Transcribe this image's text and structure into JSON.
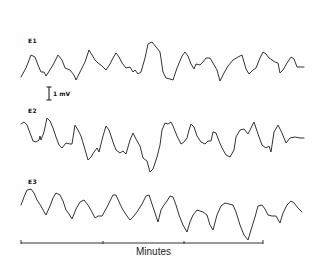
{
  "figure": {
    "traces": [
      {
        "label": "E1",
        "label_x": 28,
        "label_y": 37
      },
      {
        "label": "E2",
        "label_x": 28,
        "label_y": 107
      },
      {
        "label": "E3",
        "label_x": 28,
        "label_y": 177
      }
    ],
    "scale_bar": {
      "label": "1 mV"
    },
    "time_axis": {
      "label": "Minutes",
      "ticks": 4
    }
  },
  "chart_data": {
    "type": "line",
    "title": "",
    "xlabel": "Minutes",
    "ylabel": "",
    "scale_bar": "1 mV",
    "grid": false,
    "x_ticks_count": 4,
    "series": [
      {
        "name": "E1",
        "points": [
          [
            21,
            77
          ],
          [
            26,
            68
          ],
          [
            31,
            55
          ],
          [
            35,
            57
          ],
          [
            38,
            65
          ],
          [
            41,
            72
          ],
          [
            44,
            72
          ],
          [
            46,
            76
          ],
          [
            48,
            73
          ],
          [
            53,
            65
          ],
          [
            58,
            55
          ],
          [
            62,
            60
          ],
          [
            65,
            68
          ],
          [
            70,
            70
          ],
          [
            74,
            75
          ],
          [
            76,
            80
          ],
          [
            80,
            72
          ],
          [
            85,
            62
          ],
          [
            89,
            50
          ],
          [
            92,
            55
          ],
          [
            95,
            60
          ],
          [
            98,
            63
          ],
          [
            102,
            66
          ],
          [
            106,
            70
          ],
          [
            110,
            64
          ],
          [
            113,
            58
          ],
          [
            116,
            53
          ],
          [
            119,
            57
          ],
          [
            122,
            63
          ],
          [
            126,
            68
          ],
          [
            130,
            67
          ],
          [
            133,
            72
          ],
          [
            135,
            70
          ],
          [
            138,
            74
          ],
          [
            141,
            72
          ],
          [
            145,
            58
          ],
          [
            148,
            44
          ],
          [
            152,
            42
          ],
          [
            156,
            47
          ],
          [
            160,
            52
          ],
          [
            163,
            72
          ],
          [
            166,
            78
          ],
          [
            170,
            79
          ],
          [
            173,
            80
          ],
          [
            177,
            68
          ],
          [
            182,
            56
          ],
          [
            185,
            52
          ],
          [
            188,
            56
          ],
          [
            191,
            64
          ],
          [
            194,
            69
          ],
          [
            196,
            64
          ],
          [
            200,
            65
          ],
          [
            203,
            62
          ],
          [
            206,
            58
          ],
          [
            210,
            58
          ],
          [
            213,
            63
          ],
          [
            217,
            70
          ],
          [
            220,
            81
          ],
          [
            224,
            73
          ],
          [
            228,
            66
          ],
          [
            233,
            60
          ],
          [
            238,
            57
          ],
          [
            242,
            55
          ],
          [
            246,
            69
          ],
          [
            249,
            74
          ],
          [
            253,
            70
          ],
          [
            256,
            68
          ],
          [
            260,
            58
          ],
          [
            263,
            52
          ],
          [
            266,
            54
          ],
          [
            269,
            58
          ],
          [
            272,
            60
          ],
          [
            275,
            62
          ],
          [
            278,
            63
          ],
          [
            280,
            73
          ],
          [
            283,
            70
          ],
          [
            287,
            63
          ],
          [
            291,
            57
          ],
          [
            294,
            59
          ],
          [
            297,
            67
          ],
          [
            300,
            67
          ],
          [
            304,
            67
          ]
        ]
      },
      {
        "name": "E2",
        "points": [
          [
            21,
            124
          ],
          [
            24,
            122
          ],
          [
            27,
            125
          ],
          [
            30,
            133
          ],
          [
            33,
            141
          ],
          [
            36,
            142
          ],
          [
            39,
            140
          ],
          [
            40,
            136
          ],
          [
            41,
            140
          ],
          [
            44,
            132
          ],
          [
            47,
            118
          ],
          [
            50,
            121
          ],
          [
            53,
            128
          ],
          [
            56,
            137
          ],
          [
            59,
            145
          ],
          [
            62,
            148
          ],
          [
            66,
            143
          ],
          [
            70,
            144
          ],
          [
            72,
            144
          ],
          [
            75,
            125
          ],
          [
            78,
            130
          ],
          [
            81,
            136
          ],
          [
            84,
            146
          ],
          [
            88,
            160
          ],
          [
            91,
            157
          ],
          [
            94,
            152
          ],
          [
            97,
            148
          ],
          [
            99,
            152
          ],
          [
            103,
            136
          ],
          [
            106,
            126
          ],
          [
            109,
            130
          ],
          [
            113,
            142
          ],
          [
            116,
            150
          ],
          [
            120,
            153
          ],
          [
            123,
            151
          ],
          [
            126,
            154
          ],
          [
            130,
            140
          ],
          [
            133,
            133
          ],
          [
            136,
            139
          ],
          [
            140,
            146
          ],
          [
            143,
            158
          ],
          [
            147,
            161
          ],
          [
            150,
            172
          ],
          [
            153,
            169
          ],
          [
            157,
            157
          ],
          [
            160,
            145
          ],
          [
            162,
            130
          ],
          [
            165,
            123
          ],
          [
            168,
            124
          ],
          [
            171,
            122
          ],
          [
            173,
            126
          ],
          [
            177,
            136
          ],
          [
            181,
            144
          ],
          [
            184,
            142
          ],
          [
            187,
            138
          ],
          [
            189,
            130
          ],
          [
            191,
            124
          ],
          [
            194,
            127
          ],
          [
            197,
            136
          ],
          [
            201,
            142
          ],
          [
            205,
            144
          ],
          [
            208,
            141
          ],
          [
            211,
            141
          ],
          [
            213,
            132
          ],
          [
            216,
            133
          ],
          [
            219,
            141
          ],
          [
            222,
            148
          ],
          [
            226,
            155
          ],
          [
            230,
            157
          ],
          [
            234,
            150
          ],
          [
            236,
            137
          ],
          [
            240,
            130
          ],
          [
            244,
            129
          ],
          [
            248,
            134
          ],
          [
            251,
            128
          ],
          [
            254,
            122
          ],
          [
            258,
            134
          ],
          [
            262,
            145
          ],
          [
            266,
            148
          ],
          [
            269,
            146
          ],
          [
            271,
            152
          ],
          [
            274,
            132
          ],
          [
            278,
            125
          ],
          [
            282,
            133
          ],
          [
            286,
            143
          ],
          [
            290,
            138
          ],
          [
            295,
            137
          ],
          [
            300,
            138
          ],
          [
            304,
            138
          ]
        ]
      },
      {
        "name": "E3",
        "points": [
          [
            21,
            205
          ],
          [
            24,
            197
          ],
          [
            27,
            190
          ],
          [
            31,
            189
          ],
          [
            34,
            193
          ],
          [
            37,
            200
          ],
          [
            41,
            206
          ],
          [
            43,
            210
          ],
          [
            46,
            215
          ],
          [
            50,
            206
          ],
          [
            53,
            198
          ],
          [
            56,
            193
          ],
          [
            60,
            195
          ],
          [
            63,
            201
          ],
          [
            66,
            210
          ],
          [
            69,
            214
          ],
          [
            72,
            219
          ],
          [
            76,
            209
          ],
          [
            80,
            202
          ],
          [
            84,
            200
          ],
          [
            88,
            205
          ],
          [
            92,
            212
          ],
          [
            95,
            218
          ],
          [
            98,
            216
          ],
          [
            102,
            216
          ],
          [
            106,
            209
          ],
          [
            110,
            201
          ],
          [
            113,
            195
          ],
          [
            116,
            195
          ],
          [
            120,
            204
          ],
          [
            123,
            210
          ],
          [
            127,
            216
          ],
          [
            130,
            220
          ],
          [
            133,
            217
          ],
          [
            137,
            212
          ],
          [
            142,
            204
          ],
          [
            146,
            196
          ],
          [
            149,
            195
          ],
          [
            152,
            204
          ],
          [
            155,
            213
          ],
          [
            158,
            222
          ],
          [
            161,
            210
          ],
          [
            164,
            205
          ],
          [
            167,
            201
          ],
          [
            170,
            196
          ],
          [
            173,
            197
          ],
          [
            176,
            205
          ],
          [
            179,
            215
          ],
          [
            183,
            225
          ],
          [
            187,
            232
          ],
          [
            190,
            222
          ],
          [
            193,
            215
          ],
          [
            197,
            210
          ],
          [
            200,
            211
          ],
          [
            203,
            212
          ],
          [
            207,
            215
          ],
          [
            210,
            225
          ],
          [
            213,
            230
          ],
          [
            217,
            215
          ],
          [
            221,
            206
          ],
          [
            225,
            203
          ],
          [
            229,
            204
          ],
          [
            233,
            205
          ],
          [
            236,
            212
          ],
          [
            240,
            225
          ],
          [
            244,
            235
          ],
          [
            248,
            240
          ],
          [
            251,
            230
          ],
          [
            255,
            217
          ],
          [
            258,
            206
          ],
          [
            262,
            205
          ],
          [
            265,
            209
          ],
          [
            268,
            215
          ],
          [
            272,
            216
          ],
          [
            276,
            216
          ],
          [
            280,
            223
          ],
          [
            283,
            213
          ],
          [
            287,
            205
          ],
          [
            291,
            201
          ],
          [
            294,
            203
          ],
          [
            298,
            208
          ],
          [
            302,
            212
          ]
        ]
      }
    ]
  }
}
